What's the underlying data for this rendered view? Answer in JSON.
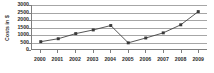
{
  "chart_data": {
    "type": "line",
    "title": "",
    "subtitle": "",
    "xlabel": "",
    "ylabel": "Costs in $",
    "categories": [
      "2000",
      "2001",
      "2002",
      "2003",
      "2004",
      "2005",
      "2006",
      "2007",
      "2008",
      "2009"
    ],
    "values": [
      500,
      700,
      1050,
      1300,
      1600,
      420,
      750,
      1100,
      1650,
      2550
    ],
    "series": [
      {
        "name": "Costs",
        "values": [
          500,
          700,
          1050,
          1300,
          1600,
          420,
          750,
          1100,
          1650,
          2550
        ]
      }
    ],
    "ylim": [
      0,
      3000
    ],
    "ytick_labels": [
      "0",
      "500",
      "1000",
      "1500",
      "2000",
      "2500",
      "3000"
    ],
    "ytick_values": [
      0,
      500,
      1000,
      1500,
      2000,
      2500,
      3000
    ],
    "xtick_labels": [
      "2000",
      "2001",
      "2002",
      "2003",
      "2004",
      "2005",
      "2006",
      "2007",
      "2008",
      "2009"
    ],
    "grid": true,
    "grid_axis": "y",
    "legend": false,
    "legend_position": "none",
    "marker": "square",
    "annotations": [],
    "colors": {
      "line": "#404040",
      "marker": "#3a3a3a",
      "grid": "#a6a6a6",
      "axis": "#7f7f7f",
      "text": "#2b2b2b",
      "plot_background": "#ffffff",
      "figure_background": "#ffffff"
    }
  }
}
